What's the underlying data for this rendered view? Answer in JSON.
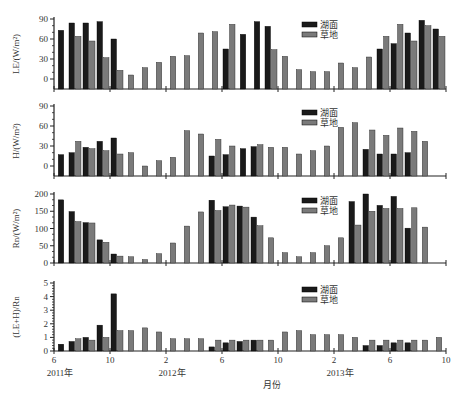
{
  "chart_data": {
    "type": "bar",
    "layout": "4 stacked panels sharing x-axis",
    "xlabel": "月份",
    "x_ticks": [
      {
        "month_index": 0,
        "label": "6",
        "year_label": "2011年"
      },
      {
        "month_index": 4,
        "label": "10",
        "year_label": ""
      },
      {
        "month_index": 8,
        "label": "2",
        "year_label": "2012年"
      },
      {
        "month_index": 12,
        "label": "6",
        "year_label": ""
      },
      {
        "month_index": 16,
        "label": "10",
        "year_label": ""
      },
      {
        "month_index": 20,
        "label": "2",
        "year_label": "2013年"
      },
      {
        "month_index": 24,
        "label": "6",
        "year_label": ""
      },
      {
        "month_index": 28,
        "label": "10",
        "year_label": ""
      }
    ],
    "categories": [
      "2011-06",
      "2011-07",
      "2011-08",
      "2011-09",
      "2011-10",
      "2011-11",
      "2011-12",
      "2012-01",
      "2012-02",
      "2012-03",
      "2012-04",
      "2012-05",
      "2012-06",
      "2012-07",
      "2012-08",
      "2012-09",
      "2012-10",
      "2012-11",
      "2012-12",
      "2013-01",
      "2013-02",
      "2013-03",
      "2013-04",
      "2013-05",
      "2013-06",
      "2013-07",
      "2013-08",
      "2013-09"
    ],
    "legend": [
      {
        "name": "湖面",
        "color": "#1a1a1a"
      },
      {
        "name": "草地",
        "color": "#7a7a7a"
      }
    ],
    "legend_position": "upper center",
    "grid": false,
    "panels": [
      {
        "ylabel": "LE/(W/m²)",
        "ylim": [
          -15,
          90
        ],
        "yticks": [
          0,
          30,
          60,
          90
        ],
        "series": [
          {
            "name": "湖面",
            "values": [
              73,
              84,
              84,
              86,
              60,
              null,
              null,
              null,
              null,
              null,
              null,
              null,
              45,
              67,
              86,
              79,
              null,
              null,
              null,
              null,
              null,
              null,
              null,
              45,
              53,
              69,
              88,
              75
            ]
          },
          {
            "name": "草地",
            "values": [
              null,
              64,
              57,
              32,
              13,
              6,
              17,
              25,
              34,
              35,
              69,
              71,
              82,
              null,
              null,
              44,
              34,
              14,
              11,
              11,
              24,
              17,
              33,
              64,
              82,
              57,
              80,
              64
            ]
          }
        ]
      },
      {
        "ylabel": "H/(W/m²)",
        "ylim": [
          -10,
          90
        ],
        "yticks": [
          0,
          30,
          60,
          90
        ],
        "series": [
          {
            "name": "湖面",
            "values": [
              17,
              20,
              28,
              37,
              42,
              null,
              null,
              null,
              null,
              null,
              null,
              15,
              17,
              26,
              29,
              null,
              null,
              null,
              null,
              null,
              null,
              null,
              25,
              18,
              18,
              20,
              null,
              null
            ]
          },
          {
            "name": "草地",
            "values": [
              null,
              37,
              26,
              23,
              18,
              20,
              0,
              8,
              13,
              53,
              48,
              40,
              30,
              null,
              32,
              28,
              28,
              18,
              23,
              30,
              58,
              65,
              54,
              46,
              57,
              52,
              37,
              null
            ]
          }
        ]
      },
      {
        "ylabel": "Rn/(W/m²)",
        "ylim": [
          0,
          200
        ],
        "yticks": [
          0,
          50,
          100,
          150,
          200
        ],
        "series": [
          {
            "name": "湖面",
            "values": [
              183,
              149,
              117,
              67,
              26,
              null,
              null,
              null,
              null,
              null,
              null,
              182,
              163,
              165,
              133,
              null,
              null,
              null,
              null,
              null,
              null,
              178,
              200,
              167,
              193,
              101,
              null,
              null
            ]
          },
          {
            "name": "草地",
            "values": [
              null,
              120,
              116,
              60,
              20,
              18,
              10,
              27,
              58,
              107,
              148,
              152,
              168,
              162,
              108,
              73,
              30,
              18,
              30,
              50,
              73,
              110,
              150,
              158,
              158,
              160,
              104,
              null
            ]
          }
        ]
      },
      {
        "ylabel": "(LE+H)/Rn",
        "ylim": [
          0,
          5
        ],
        "yticks": [
          0,
          1,
          2,
          3,
          4,
          5
        ],
        "series": [
          {
            "name": "湖面",
            "values": [
              0.5,
              0.7,
              1.0,
              1.9,
              4.2,
              null,
              null,
              null,
              null,
              null,
              null,
              0.3,
              0.6,
              0.7,
              0.8,
              null,
              null,
              null,
              null,
              null,
              null,
              null,
              0.4,
              0.4,
              0.6,
              0.6,
              null,
              null
            ]
          },
          {
            "name": "草地",
            "values": [
              null,
              0.9,
              0.8,
              1.0,
              1.5,
              1.5,
              1.7,
              1.4,
              0.9,
              0.9,
              0.9,
              0.8,
              0.8,
              0.8,
              0.8,
              0.8,
              1.4,
              1.5,
              1.2,
              1.2,
              1.2,
              1.0,
              0.8,
              0.8,
              0.8,
              0.8,
              0.8,
              1.0
            ]
          }
        ]
      }
    ]
  }
}
